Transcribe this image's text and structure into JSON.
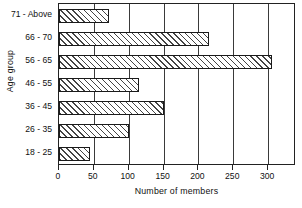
{
  "chart_data": {
    "type": "bar",
    "orientation": "horizontal",
    "title": "",
    "xlabel": "Number of members",
    "ylabel": "Age group",
    "categories": [
      "18 - 25",
      "26 - 35",
      "36 - 45",
      "46 - 55",
      "56 - 65",
      "66 - 70",
      "71 - Above"
    ],
    "values": [
      45,
      100,
      150,
      115,
      305,
      215,
      72
    ],
    "xlim": [
      0,
      340
    ],
    "xticks": [
      0,
      50,
      100,
      150,
      200,
      250,
      300
    ],
    "xticklabels": [
      "0",
      "50",
      "100",
      "150",
      "200",
      "250",
      "300"
    ],
    "grid": "vertical",
    "legend": "none",
    "bar_fill": "hatched-diagonal",
    "bar_edge_color": "#1a1a1a",
    "background_color": "#ffffff"
  }
}
